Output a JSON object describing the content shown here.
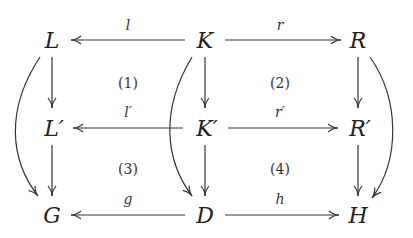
{
  "nodes": {
    "L": "L",
    "K": "K",
    "R": "R",
    "Lp": "L′",
    "Kp": "K′",
    "Rp": "R′",
    "G": "G",
    "D": "D",
    "H": "H"
  },
  "edges": {
    "l": "l",
    "r": "r",
    "lp": "l′",
    "rp": "r′",
    "g": "g",
    "h": "h"
  },
  "regions": [
    "(1)",
    "(2)",
    "(3)",
    "(4)"
  ]
}
